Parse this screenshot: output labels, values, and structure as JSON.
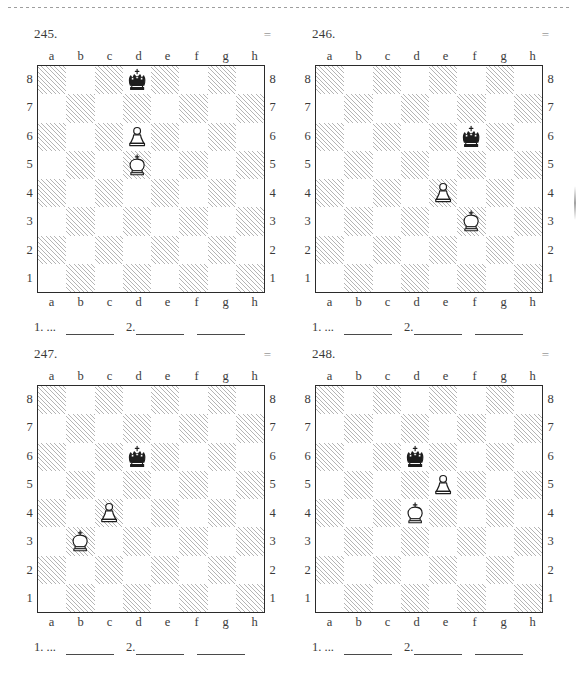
{
  "page": {
    "cut_line": "dashed-cut-line",
    "files": [
      "a",
      "b",
      "c",
      "d",
      "e",
      "f",
      "g",
      "h"
    ],
    "ranks": [
      "8",
      "7",
      "6",
      "5",
      "4",
      "3",
      "2",
      "1"
    ],
    "answer": {
      "first_move_label": "1. ...",
      "second_move_label": "2."
    },
    "colors": {
      "ink": "#2b2b2b",
      "light_square": "#ffffff",
      "dark_square_hatch": "#b4b4b4",
      "result_mark": "#9a9a9a"
    }
  },
  "puzzles": [
    {
      "number": "245.",
      "result": "=",
      "pieces": [
        {
          "piece": "black-king",
          "square": "d8",
          "file": 3,
          "rank": 8
        },
        {
          "piece": "white-pawn",
          "square": "d6",
          "file": 3,
          "rank": 6
        },
        {
          "piece": "white-king",
          "square": "d5",
          "file": 3,
          "rank": 5
        }
      ]
    },
    {
      "number": "246.",
      "result": "=",
      "pieces": [
        {
          "piece": "black-king",
          "square": "f6",
          "file": 5,
          "rank": 6
        },
        {
          "piece": "white-pawn",
          "square": "e4",
          "file": 4,
          "rank": 4
        },
        {
          "piece": "white-king",
          "square": "f3",
          "file": 5,
          "rank": 3
        }
      ]
    },
    {
      "number": "247.",
      "result": "=",
      "pieces": [
        {
          "piece": "black-king",
          "square": "d6",
          "file": 3,
          "rank": 6
        },
        {
          "piece": "white-pawn",
          "square": "c4",
          "file": 2,
          "rank": 4
        },
        {
          "piece": "white-king",
          "square": "b3",
          "file": 1,
          "rank": 3
        }
      ]
    },
    {
      "number": "248.",
      "result": "=",
      "pieces": [
        {
          "piece": "black-king",
          "square": "d6",
          "file": 3,
          "rank": 6
        },
        {
          "piece": "white-pawn",
          "square": "e5",
          "file": 4,
          "rank": 5
        },
        {
          "piece": "white-king",
          "square": "d4",
          "file": 3,
          "rank": 4
        }
      ]
    }
  ]
}
